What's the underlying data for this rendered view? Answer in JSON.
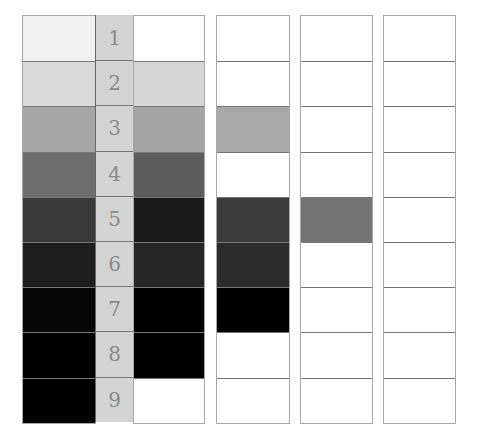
{
  "rows": [
    "1",
    "2",
    "3",
    "4",
    "5",
    "6",
    "7",
    "8",
    "9"
  ],
  "columns": [
    {
      "name": "column-a",
      "colors": [
        "#f0f0f0",
        "#d8d8d8",
        "#a6a6a6",
        "#6e6e6e",
        "#3a3a3a",
        "#1e1e1e",
        "#060606",
        "#000000",
        "#000000"
      ]
    },
    {
      "name": "column-b",
      "colors": [
        "#ffffff",
        "#d6d6d6",
        "#a4a4a4",
        "#5c5c5c",
        "#1a1a1a",
        "#262626",
        "#000000",
        "#000000",
        "#ffffff"
      ]
    },
    {
      "name": "column-c",
      "colors": [
        "#ffffff",
        "#ffffff",
        "#a8a8a8",
        "#ffffff",
        "#3c3c3c",
        "#2c2c2c",
        "#000000",
        "#ffffff",
        "#ffffff"
      ]
    },
    {
      "name": "column-d",
      "colors": [
        "#ffffff",
        "#ffffff",
        "#ffffff",
        "#ffffff",
        "#737373",
        "#ffffff",
        "#ffffff",
        "#ffffff",
        "#ffffff"
      ]
    },
    {
      "name": "column-e",
      "colors": [
        "#ffffff",
        "#ffffff",
        "#ffffff",
        "#ffffff",
        "#ffffff",
        "#ffffff",
        "#ffffff",
        "#ffffff",
        "#ffffff"
      ]
    }
  ],
  "label_column_color": "#d4d4d4"
}
